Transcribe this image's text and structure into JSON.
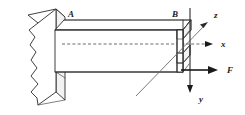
{
  "figure": {
    "background_color": "#ffffff",
    "line_color": "#2b2b2b",
    "labels": {
      "point_a": "A",
      "point_b": "B",
      "axis_x": "x",
      "axis_y": "y",
      "axis_z": "z",
      "force": "F"
    },
    "elements": {
      "wall_name": "fixed-support-wall",
      "beam_name": "cantilever-beam",
      "centerline_name": "beam-centerline",
      "cross_section_name": "channel-cross-section"
    },
    "geometry": {
      "beam_top_y": 20,
      "beam_bottom_y": 72,
      "centerline_y": 44,
      "beam_left_x": 55,
      "beam_right_x": 183,
      "origin_x": 183,
      "origin_y": 44
    },
    "axes": [
      {
        "name": "x",
        "direction": "right",
        "style": "dashed",
        "label": "x"
      },
      {
        "name": "y",
        "direction": "down",
        "style": "solid",
        "label": "y"
      },
      {
        "name": "z",
        "direction": "up-right-oblique",
        "style": "solid",
        "label": "z"
      }
    ],
    "force": {
      "label": "F",
      "direction": "right",
      "applied_at": "beam-free-end-lower-flange"
    }
  }
}
